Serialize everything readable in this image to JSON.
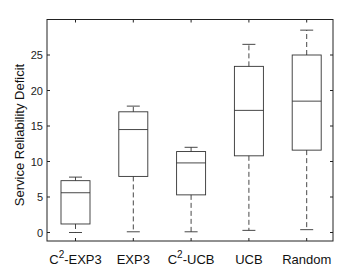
{
  "chart_data": {
    "type": "box",
    "title": "",
    "xlabel": "",
    "ylabel": "Service Reliability Deficit",
    "ylim": [
      -2,
      29.5
    ],
    "yticks": [
      0,
      5,
      10,
      15,
      20,
      25
    ],
    "grid": false,
    "legend": null,
    "categories": [
      {
        "label": "C",
        "sup": "2",
        "suffix": "-EXP3"
      },
      {
        "label": "EXP3",
        "sup": "",
        "suffix": ""
      },
      {
        "label": "C",
        "sup": "2",
        "suffix": "-UCB"
      },
      {
        "label": "UCB",
        "sup": "",
        "suffix": ""
      },
      {
        "label": "Random",
        "sup": "",
        "suffix": ""
      }
    ],
    "series": [
      {
        "name": "C2-EXP3",
        "whisker_low": 0.0,
        "q1": 1.2,
        "median": 5.6,
        "q3": 7.3,
        "whisker_high": 7.8
      },
      {
        "name": "EXP3",
        "whisker_low": 0.1,
        "q1": 7.9,
        "median": 14.5,
        "q3": 17.0,
        "whisker_high": 17.8
      },
      {
        "name": "C2-UCB",
        "whisker_low": 0.1,
        "q1": 5.3,
        "median": 9.8,
        "q3": 11.4,
        "whisker_high": 12.0
      },
      {
        "name": "UCB",
        "whisker_low": 0.3,
        "q1": 10.8,
        "median": 17.2,
        "q3": 23.4,
        "whisker_high": 26.5
      },
      {
        "name": "Random",
        "whisker_low": 0.4,
        "q1": 11.6,
        "median": 18.5,
        "q3": 25.0,
        "whisker_high": 28.5
      }
    ]
  },
  "colors": {
    "axis": "#222222",
    "box": "#333333",
    "background": "#ffffff"
  }
}
